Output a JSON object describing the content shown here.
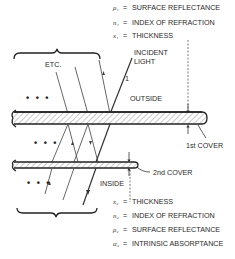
{
  "diagram": {
    "regions": {
      "outside": "OUTSIDE",
      "inside": "INSIDE"
    },
    "incident": {
      "label_line1": "INCIDENT",
      "label_line2": "LIGHT",
      "ray_number": "1"
    },
    "etc_label": "ETC.",
    "ellipsis": "• • •",
    "covers": [
      {
        "name": "1st cover",
        "label": "1st COVER"
      },
      {
        "name": "2nd cover",
        "label": "2nd COVER"
      }
    ],
    "legend_top": [
      {
        "symbol": "ρ₁",
        "eq": "=",
        "text": "SURFACE REFLECTANCE"
      },
      {
        "symbol": "n₁",
        "eq": "=",
        "text": "INDEX OF REFRACTION"
      },
      {
        "symbol": "x₁",
        "eq": "=",
        "text": "THICKNESS"
      }
    ],
    "legend_bottom": [
      {
        "symbol": "x₂",
        "eq": "=",
        "text": "THICKNESS"
      },
      {
        "symbol": "n₂",
        "eq": "=",
        "text": "INDEX OF REFRACTION"
      },
      {
        "symbol": "ρ₂",
        "eq": "=",
        "text": "SURFACE REFLECTANCE"
      },
      {
        "symbol": "α₂",
        "eq": "=",
        "text": "INTRINSIC ABSORPTANCE"
      }
    ]
  }
}
